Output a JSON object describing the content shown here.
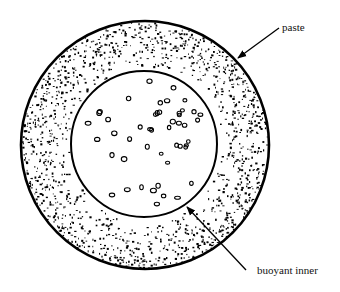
{
  "diagram": {
    "type": "cross-section",
    "labels": {
      "outer": "paste",
      "inner": "buoyant inner"
    },
    "outer_circle": {
      "cx": 145,
      "cy": 145,
      "r": 124
    },
    "inner_circle": {
      "cx": 144,
      "cy": 144,
      "r": 73
    },
    "colors": {
      "line": "#000000",
      "background": "#ffffff"
    }
  }
}
